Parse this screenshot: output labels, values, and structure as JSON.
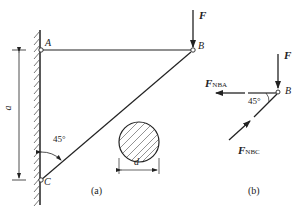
{
  "figure_a": {
    "caption": "(a)",
    "points": {
      "A": "A",
      "B": "B",
      "C": "C"
    },
    "force_label": "F",
    "angle_label": "45°",
    "dimension_height": "a",
    "dimension_diameter": "d"
  },
  "figure_b": {
    "caption": "(b)",
    "point": "B",
    "force_label": "F",
    "force_nba": {
      "main": "F",
      "sub": "NBA"
    },
    "force_nbc": {
      "main": "F",
      "sub": "NBC"
    },
    "angle_label": "45°"
  },
  "colors": {
    "line": "#222222",
    "hatch": "#555555",
    "background": "#ffffff"
  }
}
